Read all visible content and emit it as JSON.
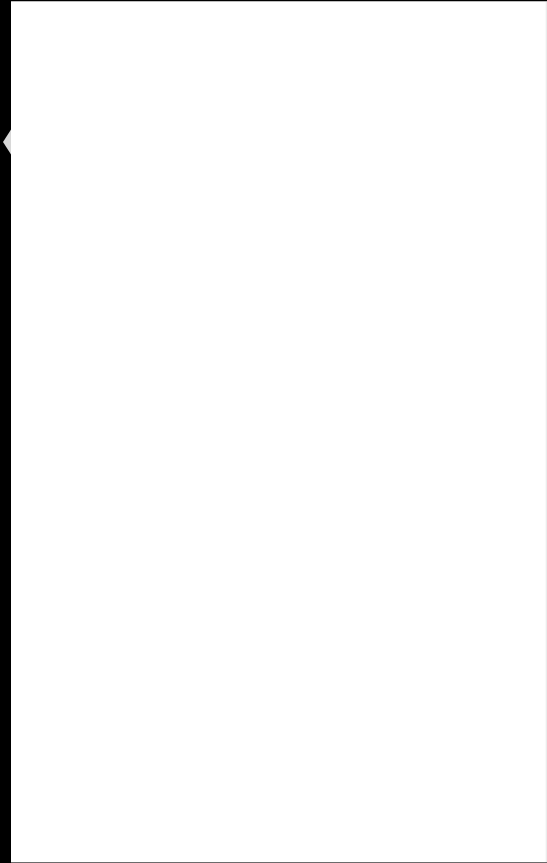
{
  "page": {
    "description": "",
    "background_color": "#ffffff",
    "edge_color": "#000000"
  }
}
